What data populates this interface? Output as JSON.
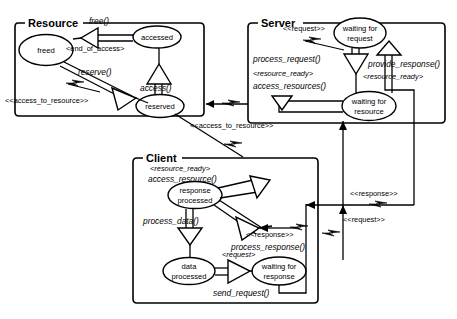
{
  "diagram": {
    "type": "uml-state-machine"
  },
  "packages": [
    {
      "id": "resource",
      "name": "Resource"
    },
    {
      "id": "server",
      "name": "Server"
    },
    {
      "id": "client",
      "name": "Client"
    }
  ],
  "states": {
    "freed": {
      "line1": "freed",
      "line2": ""
    },
    "accessed": {
      "line1": "accessed",
      "line2": ""
    },
    "reserved": {
      "line1": "reserved",
      "line2": ""
    },
    "waiting_for_request": {
      "line1": "waiting for",
      "line2": "request"
    },
    "waiting_for_resource": {
      "line1": "waiting for",
      "line2": "resource"
    },
    "response_processed": {
      "line1": "response",
      "line2": "processed"
    },
    "data_processed": {
      "line1": "data",
      "line2": "processed"
    },
    "waiting_for_response": {
      "line1": "waiting for",
      "line2": "response"
    }
  },
  "labels": {
    "free": "free()",
    "end_of_access": "<end_of_access>",
    "reserve": "reserve()",
    "access": "access()",
    "access_to_resource_1": "<<access_to_resource>>",
    "access_to_resource_2": "<<access_to_resource>>",
    "request_server": "<<request>>",
    "process_request": "process_request()",
    "resource_ready_server": "<resource_ready>",
    "access_resources": "access_resources()",
    "provide_response": "provide_response()",
    "resource_ready_right": "<resource_ready>",
    "resource_ready_client": "<resource_ready>",
    "access_resource": "access_resource()",
    "process_data": "process_data()",
    "response_client": "<<response>>",
    "process_response": "process_response()",
    "request_client": "<request>",
    "send_request": "send_request()",
    "response_link": "<<response>>",
    "request_link": "<<request>>"
  },
  "colors": {
    "stroke": "#000000",
    "fill": "#ffffff",
    "background": "#ffffff"
  }
}
